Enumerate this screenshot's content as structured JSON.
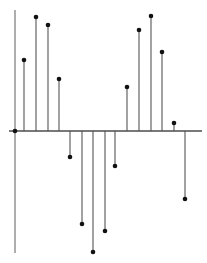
{
  "figure": {
    "width": 207,
    "height": 263,
    "background_color": "#ffffff",
    "title": "",
    "xlabel": "",
    "ylabel": ""
  },
  "axes": {
    "x_axis": {
      "name": "horizontal-baseline",
      "y_pixel": 131,
      "x_start_pixel": 9,
      "x_end_pixel": 202,
      "color": "#4d4d4d",
      "width": 1.4
    },
    "y_axis": {
      "name": "vertical-axis",
      "x_pixel": 15,
      "y_start_pixel": 10,
      "y_end_pixel": 253,
      "color": "#8c8c8c",
      "width": 1.4
    },
    "tick_labels_visible": false,
    "grid": false
  },
  "style": {
    "stem_color": "#555555",
    "stem_width": 1.1,
    "marker_color": "#111111",
    "marker_shape": "circle",
    "marker_radius": 2.3,
    "accent_color": "#111111"
  },
  "chart_data": {
    "type": "scatter",
    "subtype": "stem",
    "title": "",
    "xlabel": "",
    "ylabel": "",
    "grid": false,
    "legend": null,
    "baseline": 0,
    "xlim": [
      -0.5,
      16.5
    ],
    "ylim": [
      -125,
      120
    ],
    "x": [
      0,
      1,
      2,
      3,
      4,
      5,
      6,
      7,
      8,
      9,
      10,
      11,
      12,
      13,
      14,
      15
    ],
    "values": [
      0,
      71,
      114,
      106,
      52,
      -26,
      -93,
      -121,
      -100,
      -35,
      44,
      101,
      115,
      79,
      8,
      -68
    ],
    "pixels": {
      "x_px": [
        15,
        24,
        36,
        48,
        59,
        70,
        82,
        93,
        105,
        115,
        127,
        139,
        151,
        162,
        174,
        185
      ],
      "tip_y_px": [
        131,
        60,
        17,
        25,
        79,
        157,
        224,
        252,
        231,
        166,
        87,
        30,
        16,
        52,
        123,
        199
      ]
    }
  }
}
